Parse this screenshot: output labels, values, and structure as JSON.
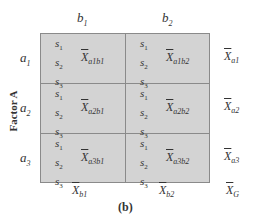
{
  "diagram": {
    "caption": "(b)",
    "factor_label": "Factor A",
    "columns": [
      {
        "label": "b",
        "sub": "1"
      },
      {
        "label": "b",
        "sub": "2"
      }
    ],
    "rows": [
      {
        "label": "a",
        "sub": "1",
        "marginal": {
          "x": "X",
          "sub": "a1"
        }
      },
      {
        "label": "a",
        "sub": "2",
        "marginal": {
          "x": "X",
          "sub": "a2"
        }
      },
      {
        "label": "a",
        "sub": "3",
        "marginal": {
          "x": "X",
          "sub": "a3"
        }
      }
    ],
    "cells": [
      [
        {
          "subjects": [
            "s1",
            "s2",
            "s3"
          ],
          "mean": "X",
          "mean_sub": "a1b1"
        },
        {
          "subjects": [
            "s1",
            "s2",
            "s3"
          ],
          "mean": "X",
          "mean_sub": "a1b2"
        }
      ],
      [
        {
          "subjects": [
            "s1",
            "s2",
            "s3"
          ],
          "mean": "X",
          "mean_sub": "a2b1"
        },
        {
          "subjects": [
            "s1",
            "s2",
            "s3"
          ],
          "mean": "X",
          "mean_sub": "a2b2"
        }
      ],
      [
        {
          "subjects": [
            "s1",
            "s2",
            "s3"
          ],
          "mean": "X",
          "mean_sub": "a3b1"
        },
        {
          "subjects": [
            "s1",
            "s2",
            "s3"
          ],
          "mean": "X",
          "mean_sub": "a3b2"
        }
      ]
    ],
    "column_marginals": [
      {
        "x": "X",
        "sub": "b1"
      },
      {
        "x": "X",
        "sub": "b2"
      }
    ],
    "grand_mean": {
      "x": "X",
      "sub": "G"
    },
    "colors": {
      "cell_fill": "#d3d3d3",
      "grid_line": "#8a8a8a",
      "text": "#333333"
    }
  }
}
